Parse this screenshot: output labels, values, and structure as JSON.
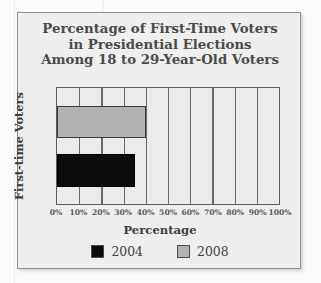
{
  "figure": {
    "title_lines": [
      "Percentage of First-Time Voters",
      "in Presidential Elections",
      "Among 18 to 29-Year-Old Voters"
    ]
  },
  "chart_data": {
    "type": "bar",
    "orientation": "horizontal",
    "title": "Percentage of First-Time Voters in Presidential Elections Among 18 to 29-Year-Old Voters",
    "xlabel": "Percentage",
    "ylabel": "First-time Voters",
    "categories": [
      "First-time Voters"
    ],
    "series": [
      {
        "name": "2004",
        "values": [
          35
        ],
        "color": "#0b0b0b"
      },
      {
        "name": "2008",
        "values": [
          40
        ],
        "color": "#b2b2b2"
      }
    ],
    "xlim": [
      0,
      100
    ],
    "xticks": [
      0,
      10,
      20,
      30,
      40,
      50,
      60,
      70,
      80,
      90,
      100
    ],
    "xtick_labels": [
      "0%",
      "10%",
      "20%",
      "30%",
      "40%",
      "50%",
      "60%",
      "70%",
      "80%",
      "90%",
      "100%"
    ],
    "grid": "vertical",
    "legend_position": "bottom",
    "legend": [
      "2004",
      "2008"
    ]
  }
}
